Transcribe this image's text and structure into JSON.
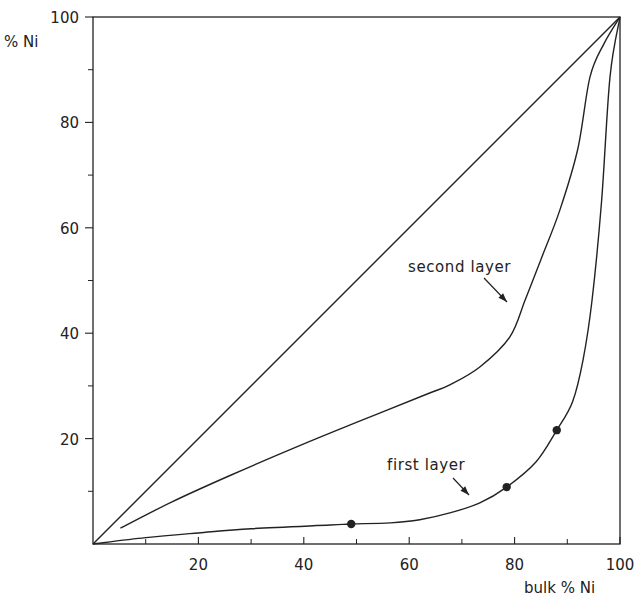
{
  "chart_data": {
    "type": "line",
    "title": "",
    "xlabel": "bulk % Ni",
    "ylabel": "% Ni",
    "xlim": [
      0,
      100
    ],
    "ylim": [
      0,
      100
    ],
    "grid": false,
    "legend": "none (curves labeled by annotations)",
    "x_ticks": [
      {
        "value": 20,
        "label": "20"
      },
      {
        "value": 40,
        "label": "40"
      },
      {
        "value": 60,
        "label": "60"
      },
      {
        "value": 80,
        "label": "80"
      },
      {
        "value": 100,
        "label": "100"
      }
    ],
    "x_minor_ticks": [
      10,
      30,
      50,
      70,
      90
    ],
    "y_ticks": [
      {
        "value": 20,
        "label": "20"
      },
      {
        "value": 40,
        "label": "40"
      },
      {
        "value": 60,
        "label": "60"
      },
      {
        "value": 80,
        "label": "80"
      },
      {
        "value": 100,
        "label": "100"
      }
    ],
    "y_minor_ticks": [
      10,
      30,
      50,
      70,
      90
    ],
    "series": [
      {
        "name": "diagonal (bulk composition)",
        "style": "line",
        "x": [
          0,
          100
        ],
        "y": [
          0,
          100
        ]
      },
      {
        "name": "second layer",
        "style": "line",
        "x": [
          5.2,
          15,
          26,
          40,
          54.5,
          64,
          67.7,
          73.4,
          79.1,
          82,
          85,
          88.6,
          92,
          94.3,
          97,
          100
        ],
        "y": [
          3.0,
          8.0,
          13.0,
          19.0,
          24.9,
          28.7,
          30.2,
          33.6,
          39.3,
          46.3,
          54,
          63.4,
          75,
          88.6,
          95,
          100
        ]
      },
      {
        "name": "first layer",
        "style": "line",
        "x": [
          0,
          10,
          20,
          30,
          45,
          49,
          56.4,
          62,
          67.7,
          73.4,
          78.5,
          84,
          88,
          91,
          93,
          94.7,
          96.5,
          98.1,
          100
        ],
        "y": [
          0,
          1.2,
          2.1,
          2.9,
          3.6,
          3.8,
          4.0,
          4.6,
          5.9,
          7.8,
          10.8,
          15.5,
          21.6,
          27,
          35,
          46.3,
          65,
          88.6,
          100
        ]
      },
      {
        "name": "first layer measured points",
        "style": "scatter",
        "marker": "filled-circle",
        "x": [
          49,
          78.5,
          88
        ],
        "y": [
          3.8,
          10.8,
          21.6
        ]
      }
    ],
    "annotations": [
      {
        "text": "second layer",
        "x": 60,
        "y": 52,
        "arrow_to": [
          78.5,
          46
        ]
      },
      {
        "text": "first layer",
        "x": 56,
        "y": 13,
        "arrow_to": [
          71.5,
          9.5
        ]
      }
    ]
  },
  "labels": {
    "y_axis": "% Ni",
    "x_axis": "bulk % Ni",
    "second_layer": "second layer",
    "first_layer": "first layer"
  },
  "colors": {
    "ink": "#222222",
    "background": "#ffffff"
  }
}
